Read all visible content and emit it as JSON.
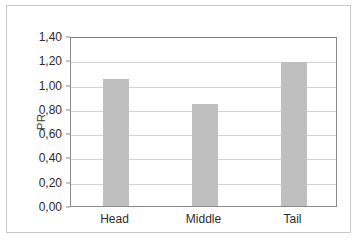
{
  "chart_data": {
    "type": "bar",
    "title": "",
    "xlabel": "",
    "ylabel": "PR",
    "categories": [
      "Head",
      "Middle",
      "Tail"
    ],
    "values": [
      1.05,
      0.84,
      1.19
    ],
    "ylim": [
      0.0,
      1.4
    ],
    "ytick_step": 0.2,
    "ytick_labels": [
      "0,00",
      "0,20",
      "0,40",
      "0,60",
      "0,80",
      "1,00",
      "1,20",
      "1,40"
    ],
    "ytick_values": [
      0.0,
      0.2,
      0.4,
      0.6,
      0.8,
      1.0,
      1.2,
      1.4
    ],
    "decimal_separator": ",",
    "grid": true,
    "grid_axis": "y",
    "legend": false,
    "legend_position": "none",
    "bar_color": "#bfbfbf",
    "gridline_color": "#d2d2d2",
    "axis_color": "#8a8a8a",
    "plot_background": "#ffffff",
    "frame_color": "#c9c9c9"
  }
}
